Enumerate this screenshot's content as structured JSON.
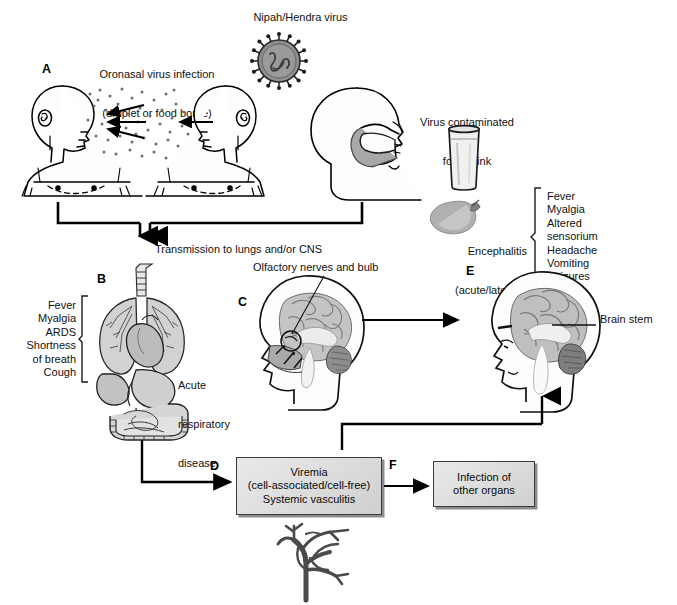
{
  "figure": {
    "title_virus": "Nipah/Hendra virus",
    "background": "#ffffff",
    "ink": "#000000",
    "box_fill": "#dcdcdc"
  },
  "panels": {
    "a": "A",
    "b": "B",
    "c": "C",
    "d": "D",
    "e": "E",
    "f": "F"
  },
  "labels": {
    "oronasal_line1": "Oronasal virus infection",
    "oronasal_line2": "(droplet or food borne)",
    "virus_particle": "Nipah/Hendra virus",
    "contaminated_line1": "Virus contaminated",
    "contaminated_line2": "food/drink",
    "transmission": "Transmission to lungs and/or CNS",
    "olfactory": "Olfactory nerves and bulb",
    "acute_resp_line1": "Acute",
    "acute_resp_line2": "respiratory",
    "acute_resp_line3": "disease",
    "brain_stem": "Brain stem",
    "encephalitis_line1": "Encephalitis",
    "encephalitis_line2": "(acute/late-onset)"
  },
  "symptoms_respiratory": [
    "Fever",
    "Myalgia",
    "ARDS",
    "Shortness",
    "of breath",
    "Cough"
  ],
  "symptoms_encephalitis": [
    "Fever",
    "Myalgia",
    "Altered",
    "sensorium",
    "Headache",
    "Vomiting",
    "Seizures"
  ],
  "boxes": {
    "viremia": {
      "line1": "Viremia",
      "line2": "(cell-associated/cell-free)",
      "line3": "Systemic vasculitis"
    },
    "other_organs": {
      "line1": "Infection of",
      "line2": "other organs"
    }
  },
  "icons": {
    "virus": "virus-particle-icon",
    "glass": "drinking-glass-icon",
    "fruit": "mango-fruit-icon",
    "lungs": "lungs-thorax-abdomen-icon",
    "head_sagittal": "head-sagittal-brain-icon",
    "head_profile": "head-profile-icon",
    "vessel": "blood-vessel-branch-icon"
  }
}
